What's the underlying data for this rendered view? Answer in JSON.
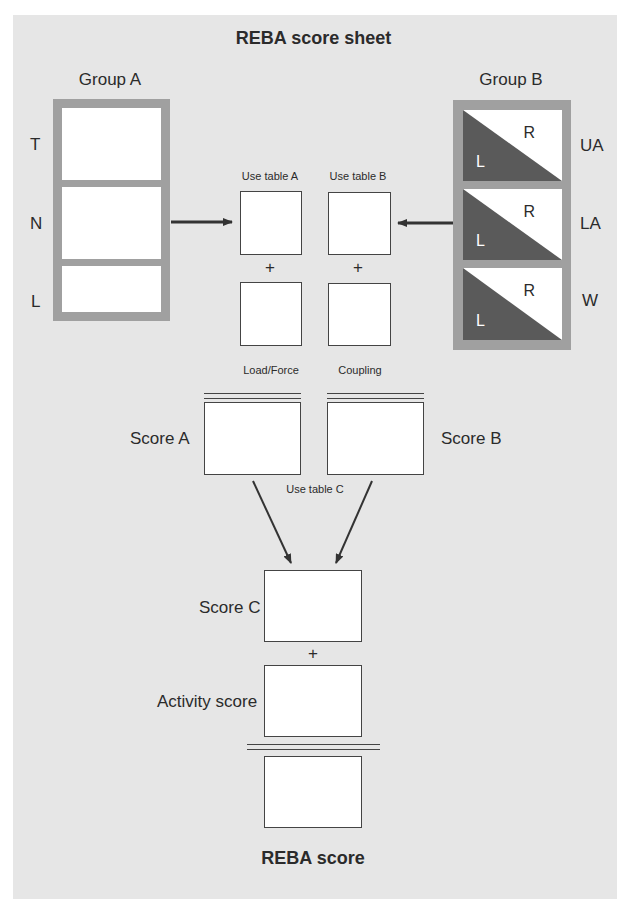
{
  "sheet": {
    "title": "REBA score sheet",
    "footer_title": "REBA score"
  },
  "group_a": {
    "label": "Group A",
    "rows": [
      {
        "label": "T"
      },
      {
        "label": "N"
      },
      {
        "label": "L"
      }
    ]
  },
  "group_b": {
    "label": "Group B",
    "rows": [
      {
        "label": "UA",
        "left": "L",
        "right": "R"
      },
      {
        "label": "LA",
        "left": "L",
        "right": "R"
      },
      {
        "label": "W",
        "left": "L",
        "right": "R"
      }
    ]
  },
  "tables": {
    "table_a": "Use table A",
    "table_b": "Use table B",
    "table_c": "Use table C",
    "plus": "+"
  },
  "modifiers": {
    "load_force": "Load/Force",
    "coupling": "Coupling"
  },
  "scores": {
    "score_a": "Score A",
    "score_b": "Score B",
    "score_c": "Score C",
    "activity": "Activity score"
  },
  "colors": {
    "panel": "#e6e6e6",
    "frame": "#a0a0a0",
    "dark_triangle": "#5a5a5a",
    "arrow": "#333333"
  }
}
